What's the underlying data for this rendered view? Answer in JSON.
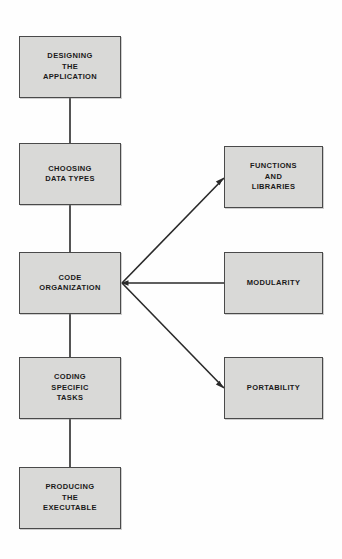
{
  "diagram": {
    "type": "flowchart",
    "background_color": "#fefefe",
    "node_fill_color": "#d9d9d7",
    "node_border_color": "#4a4a4a",
    "edge_color": "#2a2a2a",
    "text_color": "#1a1a1a",
    "main_flow": [
      {
        "id": "designing-the-application",
        "label": "DESIGNING\nTHE\nAPPLICATION",
        "x": 19,
        "y": 36,
        "width": 102,
        "height": 62
      },
      {
        "id": "choosing-data-types",
        "label": "CHOOSING\nDATA TYPES",
        "x": 19,
        "y": 143,
        "width": 102,
        "height": 62
      },
      {
        "id": "code-organization",
        "label": "CODE\nORGANIZATION",
        "x": 19,
        "y": 252,
        "width": 102,
        "height": 62
      },
      {
        "id": "coding-specific-tasks",
        "label": "CODING\nSPECIFIC\nTASKS",
        "x": 19,
        "y": 357,
        "width": 102,
        "height": 62
      },
      {
        "id": "producing-the-executable",
        "label": "PRODUCING\nTHE\nEXECUTABLE",
        "x": 19,
        "y": 467,
        "width": 102,
        "height": 62
      }
    ],
    "branch_nodes": [
      {
        "id": "functions-and-libraries",
        "label": "FUNCTIONS\nAND\nLIBRARIES",
        "x": 224,
        "y": 146,
        "width": 99,
        "height": 62
      },
      {
        "id": "modularity",
        "label": "MODULARITY",
        "x": 224,
        "y": 252,
        "width": 99,
        "height": 62
      },
      {
        "id": "portability",
        "label": "PORTABILITY",
        "x": 224,
        "y": 357,
        "width": 99,
        "height": 62
      }
    ],
    "connectors": [
      {
        "id": "designing-to-choosing",
        "from": "designing-the-application",
        "to": "choosing-data-types",
        "kind": "vertical",
        "x1": 70,
        "y1": 98,
        "x2": 70,
        "y2": 143
      },
      {
        "id": "choosing-to-code-organization",
        "from": "choosing-data-types",
        "to": "code-organization",
        "kind": "vertical",
        "x1": 70,
        "y1": 205,
        "x2": 70,
        "y2": 252
      },
      {
        "id": "code-organization-to-coding",
        "from": "code-organization",
        "to": "coding-specific-tasks",
        "kind": "vertical",
        "x1": 70,
        "y1": 314,
        "x2": 70,
        "y2": 357
      },
      {
        "id": "coding-to-producing",
        "from": "coding-specific-tasks",
        "to": "producing-the-executable",
        "kind": "vertical",
        "x1": 70,
        "y1": 419,
        "x2": 70,
        "y2": 467
      },
      {
        "id": "code-organization-to-functions",
        "from": "code-organization",
        "to": "functions-and-libraries",
        "kind": "diagonal-up",
        "x1": 122,
        "y1": 283,
        "x2": 224,
        "y2": 178
      },
      {
        "id": "code-organization-to-modularity",
        "from": "code-organization",
        "to": "modularity",
        "kind": "horizontal",
        "x1": 122,
        "y1": 283,
        "x2": 224,
        "y2": 283
      },
      {
        "id": "code-organization-to-portability",
        "from": "code-organization",
        "to": "portability",
        "kind": "diagonal-down",
        "x1": 122,
        "y1": 283,
        "x2": 224,
        "y2": 388
      }
    ]
  }
}
